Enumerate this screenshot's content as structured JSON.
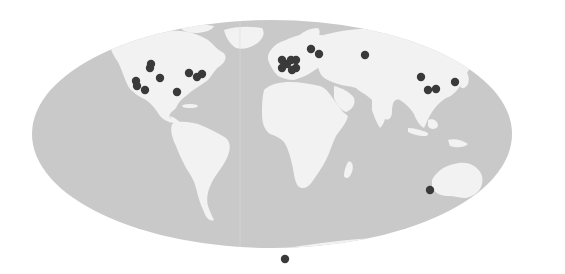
{
  "map": {
    "projection": "mollweide",
    "width": 565,
    "height": 274,
    "colors": {
      "background": "#ffffff",
      "ocean": "#c9c9c9",
      "land": "#f2f2f2",
      "marker": "#3a3a3a"
    },
    "globe": {
      "cx": 272,
      "cy": 134,
      "rx": 240,
      "ry": 114
    },
    "marker_radius": 4.2,
    "markers": [
      {
        "region": "north-america",
        "x": 151,
        "y": 64
      },
      {
        "region": "north-america",
        "x": 150,
        "y": 68
      },
      {
        "region": "north-america",
        "x": 160,
        "y": 78
      },
      {
        "region": "north-america",
        "x": 136,
        "y": 81
      },
      {
        "region": "north-america",
        "x": 137,
        "y": 86
      },
      {
        "region": "north-america",
        "x": 145,
        "y": 90
      },
      {
        "region": "north-america",
        "x": 177,
        "y": 92
      },
      {
        "region": "north-america",
        "x": 189,
        "y": 73
      },
      {
        "region": "north-america",
        "x": 197,
        "y": 77
      },
      {
        "region": "north-america",
        "x": 202,
        "y": 74
      },
      {
        "region": "europe",
        "x": 282,
        "y": 60
      },
      {
        "region": "europe",
        "x": 282,
        "y": 68
      },
      {
        "region": "europe",
        "x": 287,
        "y": 64
      },
      {
        "region": "europe",
        "x": 291,
        "y": 60
      },
      {
        "region": "europe",
        "x": 296,
        "y": 60
      },
      {
        "region": "europe",
        "x": 296,
        "y": 68
      },
      {
        "region": "europe",
        "x": 292,
        "y": 70
      },
      {
        "region": "europe",
        "x": 311,
        "y": 49
      },
      {
        "region": "europe",
        "x": 319,
        "y": 54
      },
      {
        "region": "asia",
        "x": 365,
        "y": 55
      },
      {
        "region": "asia",
        "x": 421,
        "y": 77
      },
      {
        "region": "asia",
        "x": 428,
        "y": 90
      },
      {
        "region": "asia",
        "x": 436,
        "y": 89
      },
      {
        "region": "asia",
        "x": 455,
        "y": 82
      },
      {
        "region": "oceania",
        "x": 430,
        "y": 190
      },
      {
        "region": "antarctica",
        "x": 285,
        "y": 259
      }
    ]
  }
}
